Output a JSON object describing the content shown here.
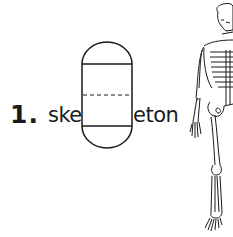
{
  "exercise": {
    "number": "1.",
    "word_prefix": "ske",
    "word_suffix": "eton",
    "missing_letter_box": {
      "type": "letter-writing-box",
      "guides": [
        "top-line",
        "dashed-midline",
        "baseline"
      ]
    },
    "illustration": "human-skeleton"
  },
  "colors": {
    "ink": "#1a1a1a",
    "background": "#ffffff"
  }
}
